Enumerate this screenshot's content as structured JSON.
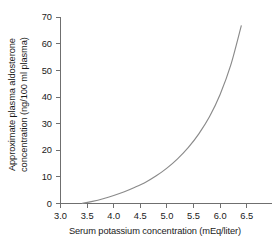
{
  "chart_data": {
    "type": "line",
    "title": "",
    "subtitle": "",
    "xlabel": "Serum potassium concentration (mEq/liter)",
    "ylabel_line1": "Approximate plasma aldosterone",
    "ylabel_line2": "concentration (ng/100 ml plasma)",
    "ylabel": "Approximate plasma aldosterone concentration (ng/100 ml plasma)",
    "xlim": [
      3.0,
      6.8
    ],
    "ylim": [
      0,
      70
    ],
    "xticks": [
      3.0,
      3.5,
      4.0,
      4.5,
      5.0,
      5.5,
      6.0,
      6.5
    ],
    "xtick_labels": [
      "3.0",
      "3.5",
      "4.0",
      "4.5",
      "5.0",
      "5.5",
      "6.0",
      "6.5"
    ],
    "yticks": [
      0,
      10,
      20,
      30,
      40,
      50,
      60,
      70
    ],
    "ytick_labels": [
      "0",
      "10",
      "20",
      "30",
      "40",
      "50",
      "60",
      "70"
    ],
    "grid": false,
    "legend": false,
    "legend_position": "none",
    "line_color": "#8a8a8a",
    "axis_color": "#6f6f6f",
    "background_color": "#ffffff",
    "series": [
      {
        "name": "Plasma aldosterone vs serum potassium",
        "x": [
          3.4,
          3.6,
          3.8,
          4.0,
          4.2,
          4.4,
          4.6,
          4.8,
          5.0,
          5.2,
          5.4,
          5.6,
          5.8,
          6.0,
          6.2,
          6.4
        ],
        "y": [
          0.0,
          0.8,
          1.8,
          3.0,
          4.4,
          6.1,
          8.0,
          10.4,
          13.3,
          16.8,
          21.0,
          26.2,
          32.6,
          41.0,
          52.0,
          67.0
        ]
      }
    ]
  }
}
